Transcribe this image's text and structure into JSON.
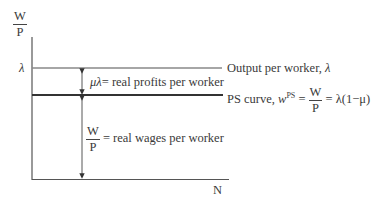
{
  "diagram": {
    "y_axis_label": {
      "numerator": "W",
      "denominator": "P"
    },
    "x_axis_label": "N",
    "lambda_tick": "λ",
    "output_line": {
      "label_prefix": "Output per worker, ",
      "label_symbol": "λ"
    },
    "ps_line": {
      "label_prefix": "PS curve, ",
      "w": "w",
      "sup": "PS",
      "eq1": "=",
      "frac_num": "W",
      "frac_den": "P",
      "eq2": "= λ(1−μ)"
    },
    "profit_annotation": {
      "symbol": "μλ",
      "text": "= real profits per worker"
    },
    "wage_annotation": {
      "frac_num": "W",
      "frac_den": "P",
      "text": "= real wages per worker"
    },
    "colors": {
      "axis": "#555555",
      "output_line": "#888888",
      "ps_line": "#333333",
      "arrow": "#444444"
    }
  }
}
